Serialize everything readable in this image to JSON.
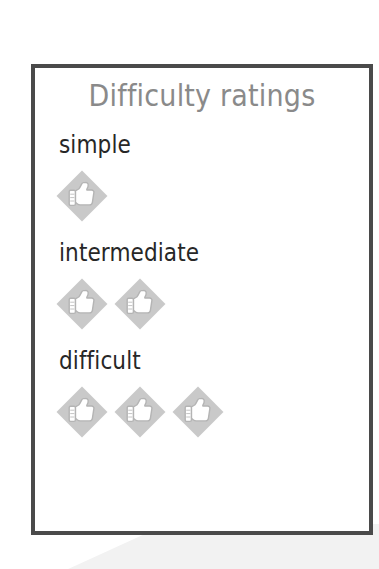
{
  "page": {
    "background_color": "#ffffff",
    "accent_gray": "#c9c9c9",
    "border_color": "#4a4a4a",
    "title_color": "#8a8a8a",
    "label_color": "#272727"
  },
  "card": {
    "title": "Difficulty ratings",
    "rows": [
      {
        "label": "simple",
        "rating": 1,
        "icon": "thumbs-up-diamond-icon"
      },
      {
        "label": "intermediate",
        "rating": 2,
        "icon": "thumbs-up-diamond-icon"
      },
      {
        "label": "difficult",
        "rating": 3,
        "icon": "thumbs-up-diamond-icon"
      }
    ]
  }
}
